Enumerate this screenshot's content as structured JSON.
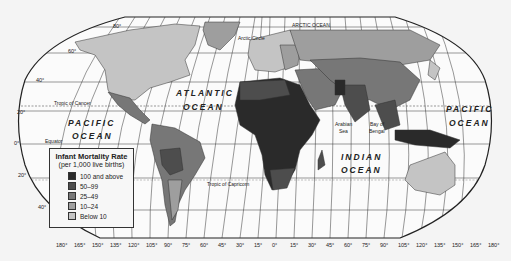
{
  "map": {
    "title": "Infant Mortality Rate",
    "projection": "Robinson",
    "oceans": [
      {
        "id": "arctic",
        "label": "ARCTIC OCEAN"
      },
      {
        "id": "atlantic_1",
        "label": "ATLANTIC"
      },
      {
        "id": "atlantic_2",
        "label": "OCEAN"
      },
      {
        "id": "pacific_w_1",
        "label": "PACIFIC"
      },
      {
        "id": "pacific_w_2",
        "label": "OCEAN"
      },
      {
        "id": "pacific_e_1",
        "label": "PACIFIC"
      },
      {
        "id": "pacific_e_2",
        "label": "OCEAN"
      },
      {
        "id": "indian_1",
        "label": "INDIAN"
      },
      {
        "id": "indian_2",
        "label": "OCEAN"
      }
    ],
    "features": {
      "arctic_circle": "Arctic Circle",
      "tropic_cancer": "Tropic of Cancer",
      "equator": "Equator",
      "tropic_capricorn": "Tropic of Capricorn",
      "arabian_sea_1": "Arabian",
      "arabian_sea_2": "Sea",
      "bay_bengal_1": "Bay of",
      "bay_bengal_2": "Bengal"
    },
    "latitude_labels": [
      "80°",
      "60°",
      "40°",
      "20°",
      "0°",
      "20°",
      "40°"
    ],
    "longitude_labels": [
      "180°",
      "165°",
      "150°",
      "135°",
      "120°",
      "105°",
      "90°",
      "75°",
      "60°",
      "45°",
      "30°",
      "15°",
      "0°",
      "15°",
      "30°",
      "45°",
      "60°",
      "75°",
      "90°",
      "105°",
      "120°",
      "135°",
      "150°",
      "165°",
      "180°"
    ]
  },
  "legend": {
    "title": "Infant Mortality Rate",
    "subtitle": "(per 1,000 live births)",
    "items": [
      {
        "label": "100 and above",
        "color": "#2a2a2a"
      },
      {
        "label": "50–99",
        "color": "#4d4d4d"
      },
      {
        "label": "25–49",
        "color": "#777777"
      },
      {
        "label": "10–24",
        "color": "#9e9e9e"
      },
      {
        "label": "Below 10",
        "color": "#c4c4c4"
      }
    ]
  }
}
